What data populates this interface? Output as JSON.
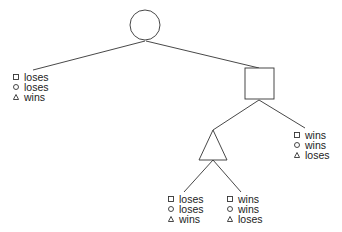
{
  "diagram": {
    "type": "game-tree",
    "nodes": [
      {
        "id": "root",
        "shape": "circle"
      },
      {
        "id": "n1",
        "shape": "square"
      },
      {
        "id": "n2",
        "shape": "triangle"
      }
    ],
    "legend_symbols": [
      "square",
      "circle",
      "triangle"
    ],
    "outcomes": {
      "left": {
        "square": "loses",
        "circle": "loses",
        "triangle": "wins"
      },
      "right": {
        "square": "wins",
        "circle": "wins",
        "triangle": "loses"
      },
      "bottom_left": {
        "square": "loses",
        "circle": "loses",
        "triangle": "wins"
      },
      "bottom_right": {
        "square": "wins",
        "circle": "wins",
        "triangle": "loses"
      }
    },
    "colors": {
      "stroke": "#333333",
      "text": "#222222"
    }
  }
}
